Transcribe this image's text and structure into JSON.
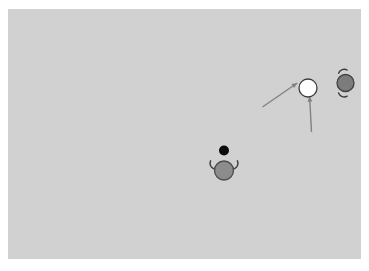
{
  "figure": {
    "canvas": {
      "width": 369,
      "height": 271,
      "background": "#ffffff"
    },
    "stage": {
      "x": 8,
      "y": 9,
      "width": 353,
      "height": 250,
      "fill": "#d1d1d1"
    },
    "arrows": [
      {
        "name": "arrow-from-lower-left",
        "x1": 262.5,
        "y1": 107,
        "x2": 297.3,
        "y2": 83,
        "color": "#828282",
        "width": 1.4,
        "head_size": 6
      },
      {
        "name": "arrow-from-below",
        "x1": 311.5,
        "y1": 132,
        "x2": 309.6,
        "y2": 96.2,
        "color": "#828282",
        "width": 1.4,
        "head_size": 6
      }
    ],
    "agents": [
      {
        "name": "agent-bottom-gray",
        "cx": 224,
        "cy": 170.5,
        "r": 9.5,
        "fill": "#8c8c8c",
        "stroke": "#4c4c4c",
        "stroke_width": 1.3,
        "hand_color": "#3d3d3d",
        "hand_width": 1.4,
        "hands": [
          "M 216.8 169.2 A 6 6 0 0 1 210.6 160.8",
          "M 231.2 169.2 A 6 6 0 0 0 237.4 160.8"
        ]
      },
      {
        "name": "agent-white",
        "cx": 308,
        "cy": 88,
        "r": 9,
        "fill": "#ffffff",
        "stroke": "#3c3c3c",
        "stroke_width": 1.3,
        "hand_color": "#3d3d3d",
        "hand_width": 1.4,
        "hands": []
      },
      {
        "name": "agent-right-gray",
        "cx": 345.5,
        "cy": 83,
        "r": 8.5,
        "fill": "#7c7c7c",
        "stroke": "#414141",
        "stroke_width": 1.3,
        "hand_color": "#3d3d3d",
        "hand_width": 1.4,
        "hands": [
          "M 338.6 73.2 A 6 6 0 0 1 347.2 70.0",
          "M 338.6 93.0 A 6 6 0 0 0 347.2 96.2"
        ]
      }
    ],
    "ball": {
      "cx": 224,
      "cy": 150.5,
      "r": 5,
      "fill": "#0b0b0b"
    }
  }
}
